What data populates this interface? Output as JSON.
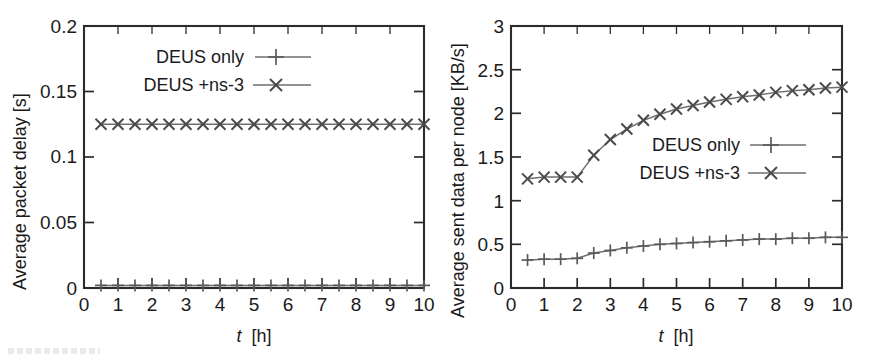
{
  "figure": {
    "panel_count": 2,
    "background": "#ffffff",
    "ink_color": "#1a1a1a",
    "series_color": "#5a5a5a"
  },
  "chart_data": [
    {
      "id": "left",
      "type": "line",
      "title": "",
      "xlabel_text": "t",
      "xlabel_unit": "[h]",
      "ylabel": "Average packet delay [s]",
      "xlim": [
        0,
        10
      ],
      "ylim": [
        0,
        0.2
      ],
      "xticks": [
        0,
        1,
        2,
        3,
        4,
        5,
        6,
        7,
        8,
        9,
        10
      ],
      "xticklabels": [
        "0",
        "1",
        "2",
        "3",
        "4",
        "5",
        "6",
        "7",
        "8",
        "9",
        "10"
      ],
      "yticks": [
        0,
        0.05,
        0.1,
        0.15,
        0.2
      ],
      "yticklabels": [
        "0",
        "0.05",
        "0.1",
        "0.15",
        "0.2"
      ],
      "xminor_step": 0.5,
      "grid": false,
      "legend_position": "upper-left-inside",
      "x": [
        0.5,
        1.0,
        1.5,
        2.0,
        2.5,
        3.0,
        3.5,
        4.0,
        4.5,
        5.0,
        5.5,
        6.0,
        6.5,
        7.0,
        7.5,
        8.0,
        8.5,
        9.0,
        9.5,
        10.0
      ],
      "series": [
        {
          "name": "DEUS only",
          "marker": "plus",
          "values": [
            0.002,
            0.002,
            0.002,
            0.002,
            0.002,
            0.002,
            0.002,
            0.002,
            0.002,
            0.002,
            0.002,
            0.002,
            0.002,
            0.002,
            0.002,
            0.002,
            0.002,
            0.002,
            0.002,
            0.002
          ]
        },
        {
          "name": "DEUS +ns-3",
          "marker": "cross",
          "values": [
            0.125,
            0.125,
            0.125,
            0.125,
            0.125,
            0.125,
            0.125,
            0.125,
            0.125,
            0.125,
            0.125,
            0.125,
            0.125,
            0.125,
            0.125,
            0.125,
            0.125,
            0.125,
            0.125,
            0.125
          ]
        }
      ]
    },
    {
      "id": "right",
      "type": "line",
      "title": "",
      "xlabel_text": "t",
      "xlabel_unit": "[h]",
      "ylabel": "Average sent data per node [KB/s]",
      "xlim": [
        0,
        10
      ],
      "ylim": [
        0,
        3
      ],
      "xticks": [
        0,
        1,
        2,
        3,
        4,
        5,
        6,
        7,
        8,
        9,
        10
      ],
      "xticklabels": [
        "0",
        "1",
        "2",
        "3",
        "4",
        "5",
        "6",
        "7",
        "8",
        "9",
        "10"
      ],
      "yticks": [
        0,
        0.5,
        1,
        1.5,
        2,
        2.5,
        3
      ],
      "yticklabels": [
        "0",
        "0.5",
        "1",
        "1.5",
        "2",
        "2.5",
        "3"
      ],
      "xminor_step": 0.5,
      "grid": false,
      "legend_position": "middle-center-inside",
      "x": [
        0.5,
        1.0,
        1.5,
        2.0,
        2.5,
        3.0,
        3.5,
        4.0,
        4.5,
        5.0,
        5.5,
        6.0,
        6.5,
        7.0,
        7.5,
        8.0,
        8.5,
        9.0,
        9.5,
        10.0
      ],
      "series": [
        {
          "name": "DEUS only",
          "marker": "plus",
          "values": [
            0.32,
            0.33,
            0.33,
            0.34,
            0.4,
            0.43,
            0.46,
            0.48,
            0.5,
            0.51,
            0.52,
            0.53,
            0.54,
            0.55,
            0.56,
            0.56,
            0.57,
            0.57,
            0.58,
            0.58
          ]
        },
        {
          "name": "DEUS +ns-3",
          "marker": "cross",
          "values": [
            1.25,
            1.27,
            1.27,
            1.27,
            1.52,
            1.7,
            1.82,
            1.92,
            1.99,
            2.05,
            2.09,
            2.13,
            2.16,
            2.19,
            2.21,
            2.24,
            2.26,
            2.27,
            2.29,
            2.3
          ]
        }
      ]
    }
  ],
  "legend": {
    "entries": [
      {
        "label": "DEUS only",
        "marker": "plus"
      },
      {
        "label": "DEUS +ns-3",
        "marker": "cross"
      }
    ]
  }
}
